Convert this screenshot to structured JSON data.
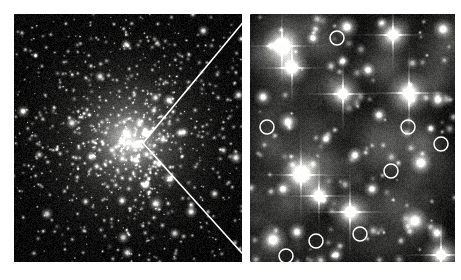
{
  "figure": {
    "background_color": "#ffffff",
    "width": 461,
    "height": 280,
    "caption": ""
  },
  "panels": [
    {
      "id": "wide-field",
      "name": "globular-cluster-wide-field",
      "label": "",
      "x": 14,
      "y": 14,
      "width": 228,
      "height": 248,
      "background_color": "#000000",
      "description": "Dense wide-field star field of a globular cluster with a bright unresolved concentrated core",
      "core": {
        "cx": 116,
        "cy": 126,
        "radius": 60,
        "peak_color": "#f2f2ee"
      },
      "star_count": 900,
      "noise_color": "#1a1a1a"
    },
    {
      "id": "hst-zoom",
      "name": "hst-zoom-field",
      "label": "",
      "x": 250,
      "y": 14,
      "width": 205,
      "height": 248,
      "background_color": "#070707",
      "description": "High resolution zoomed field showing resolved bright stars with four-point diffraction spikes and circled faint objects",
      "star_count": 120,
      "noise_color": "#232323"
    }
  ],
  "zoom_indicator": {
    "name": "zoom-vee-indicator",
    "color": "#ffffff",
    "stroke_width": 1.6,
    "apex": {
      "x": 143,
      "y": 143
    },
    "upper_end": {
      "x": 250,
      "y": 14
    },
    "lower_end": {
      "x": 250,
      "y": 262
    }
  },
  "markers": {
    "name": "circled-faint-objects",
    "stroke_color": "#ffffff",
    "stroke_width": 1.5,
    "radius": 7,
    "count": 8,
    "items": [
      {
        "label": "",
        "cx": 337,
        "cy": 38
      },
      {
        "label": "",
        "cx": 267,
        "cy": 127
      },
      {
        "label": "",
        "cx": 408,
        "cy": 127
      },
      {
        "label": "",
        "cx": 441,
        "cy": 144
      },
      {
        "label": "",
        "cx": 391,
        "cy": 171
      },
      {
        "label": "",
        "cx": 360,
        "cy": 234
      },
      {
        "label": "",
        "cx": 316,
        "cy": 241
      },
      {
        "label": "",
        "cx": 286,
        "cy": 256
      }
    ]
  },
  "bright_stars_zoom": [
    {
      "cx": 282,
      "cy": 46,
      "size": 17,
      "spikes": true
    },
    {
      "cx": 347,
      "cy": 27,
      "size": 10,
      "spikes": false
    },
    {
      "cx": 313,
      "cy": 38,
      "size": 6,
      "spikes": false
    },
    {
      "cx": 393,
      "cy": 35,
      "size": 16,
      "spikes": true
    },
    {
      "cx": 443,
      "cy": 29,
      "size": 9,
      "spikes": false
    },
    {
      "cx": 292,
      "cy": 68,
      "size": 15,
      "spikes": true
    },
    {
      "cx": 343,
      "cy": 61,
      "size": 6,
      "spikes": false
    },
    {
      "cx": 368,
      "cy": 70,
      "size": 7,
      "spikes": false
    },
    {
      "cx": 409,
      "cy": 93,
      "size": 19,
      "spikes": true
    },
    {
      "cx": 263,
      "cy": 97,
      "size": 8,
      "spikes": false
    },
    {
      "cx": 343,
      "cy": 94,
      "size": 17,
      "spikes": true
    },
    {
      "cx": 379,
      "cy": 115,
      "size": 7,
      "spikes": false
    },
    {
      "cx": 438,
      "cy": 100,
      "size": 8,
      "spikes": false
    },
    {
      "cx": 288,
      "cy": 122,
      "size": 9,
      "spikes": false
    },
    {
      "cx": 326,
      "cy": 139,
      "size": 6,
      "spikes": false
    },
    {
      "cx": 355,
      "cy": 155,
      "size": 7,
      "spikes": false
    },
    {
      "cx": 421,
      "cy": 163,
      "size": 10,
      "spikes": false
    },
    {
      "cx": 301,
      "cy": 175,
      "size": 18,
      "spikes": true
    },
    {
      "cx": 283,
      "cy": 189,
      "size": 7,
      "spikes": false
    },
    {
      "cx": 319,
      "cy": 196,
      "size": 15,
      "spikes": true
    },
    {
      "cx": 372,
      "cy": 189,
      "size": 7,
      "spikes": false
    },
    {
      "cx": 350,
      "cy": 212,
      "size": 18,
      "spikes": true
    },
    {
      "cx": 415,
      "cy": 221,
      "size": 12,
      "spikes": false
    },
    {
      "cx": 437,
      "cy": 233,
      "size": 9,
      "spikes": false
    },
    {
      "cx": 273,
      "cy": 240,
      "size": 13,
      "spikes": false
    },
    {
      "cx": 297,
      "cy": 232,
      "size": 8,
      "spikes": false
    },
    {
      "cx": 441,
      "cy": 255,
      "size": 17,
      "spikes": true
    },
    {
      "cx": 336,
      "cy": 255,
      "size": 7,
      "spikes": false
    }
  ]
}
